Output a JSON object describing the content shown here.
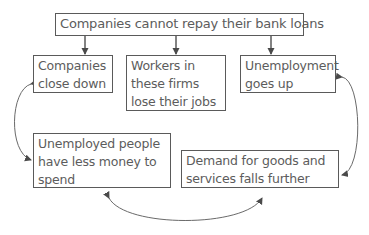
{
  "diagram": {
    "title_box": "Companies cannot repay their bank loans",
    "effects": [
      "Companies close down",
      "Workers in these firms lose their jobs",
      "Unemployment goes up"
    ],
    "cycle": [
      "Unemployed people have less money to spend",
      "Demand for goods and services falls further"
    ],
    "colors": {
      "line": "#5a5a5a",
      "text": "#5c5c5c"
    }
  }
}
